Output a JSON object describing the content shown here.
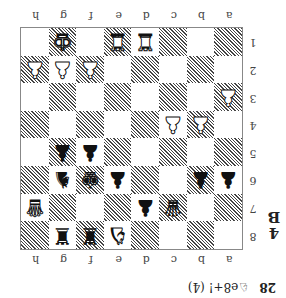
{
  "diagram": {
    "label_number": "4",
    "label_letter": "B",
    "orientation": "rotated-180",
    "files": [
      "a",
      "b",
      "c",
      "d",
      "e",
      "f",
      "g",
      "h"
    ],
    "ranks": [
      "8",
      "7",
      "6",
      "5",
      "4",
      "3",
      "2",
      "1"
    ],
    "colors": {
      "dark_square_hatch": "#444444",
      "light_square": "#ffffff",
      "border": "#888888"
    },
    "pieces": [
      {
        "square": "g1",
        "color": "white",
        "type": "king",
        "glyph": "♚"
      },
      {
        "square": "e1",
        "color": "white",
        "type": "rook",
        "glyph": "♜"
      },
      {
        "square": "d1",
        "color": "white",
        "type": "rook",
        "glyph": "♜"
      },
      {
        "square": "h2",
        "color": "white",
        "type": "pawn",
        "glyph": "♟"
      },
      {
        "square": "g2",
        "color": "white",
        "type": "pawn",
        "glyph": "♟"
      },
      {
        "square": "f2",
        "color": "white",
        "type": "pawn",
        "glyph": "♟"
      },
      {
        "square": "a3",
        "color": "white",
        "type": "pawn",
        "glyph": "♟"
      },
      {
        "square": "c4",
        "color": "white",
        "type": "pawn",
        "glyph": "♟"
      },
      {
        "square": "b4",
        "color": "white",
        "type": "pawn",
        "glyph": "♟"
      },
      {
        "square": "g5",
        "color": "black",
        "type": "pawn",
        "glyph": "♟"
      },
      {
        "square": "f5",
        "color": "black",
        "type": "pawn",
        "glyph": "♟"
      },
      {
        "square": "g6",
        "color": "black",
        "type": "knight",
        "glyph": "♞"
      },
      {
        "square": "f6",
        "color": "black",
        "type": "king",
        "glyph": "♚"
      },
      {
        "square": "e6",
        "color": "black",
        "type": "pawn",
        "glyph": "♟"
      },
      {
        "square": "b6",
        "color": "black",
        "type": "pawn",
        "glyph": "♟"
      },
      {
        "square": "a6",
        "color": "black",
        "type": "pawn",
        "glyph": "♟"
      },
      {
        "square": "h7",
        "color": "white",
        "type": "queen",
        "glyph": "♛"
      },
      {
        "square": "d7",
        "color": "black",
        "type": "pawn",
        "glyph": "♟"
      },
      {
        "square": "c7",
        "color": "black",
        "type": "queen",
        "glyph": "♛"
      },
      {
        "square": "g8",
        "color": "black",
        "type": "rook",
        "glyph": "♜"
      },
      {
        "square": "f8",
        "color": "black",
        "type": "rook",
        "glyph": "♜"
      },
      {
        "square": "e8",
        "color": "white",
        "type": "knight",
        "glyph": "♞"
      }
    ]
  },
  "caption": {
    "move_number": "28",
    "move_text": "♘e8+! (4)"
  }
}
